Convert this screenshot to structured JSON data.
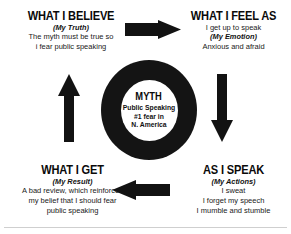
{
  "diagram": {
    "center": {
      "heading": "MYTH",
      "lines": [
        "Public Speaking",
        "#1 fear in",
        "N. America"
      ]
    },
    "quadrants": [
      {
        "id": "believe",
        "heading": "WHAT I BELIEVE",
        "label": "(My Truth)",
        "label_position": "after-heading",
        "lines": [
          "The myth must be true so",
          "i fear public speaking"
        ]
      },
      {
        "id": "feel",
        "heading": "WHAT I FEEL AS",
        "label": "(My Emotion)",
        "label_position": "second-line",
        "lead": "I get up to speak",
        "lines": [
          "Anxious and afraid"
        ]
      },
      {
        "id": "speak",
        "heading": "AS I SPEAK",
        "label": "(My Actions)",
        "label_position": "after-heading",
        "lines": [
          "I sweat",
          "I forget my speech",
          "I mumble and stumble"
        ]
      },
      {
        "id": "get",
        "heading": "WHAT I GET",
        "label": "(My Result)",
        "label_position": "after-heading",
        "lines": [
          "A bad review, which reinforces",
          "my belief that I should fear",
          "public speaking"
        ]
      }
    ],
    "arrows": [
      {
        "id": "top",
        "direction": "right",
        "from": "believe",
        "to": "feel"
      },
      {
        "id": "right",
        "direction": "down",
        "from": "feel",
        "to": "speak"
      },
      {
        "id": "bottom",
        "direction": "left",
        "from": "speak",
        "to": "get"
      },
      {
        "id": "left",
        "direction": "up",
        "from": "get",
        "to": "believe"
      }
    ],
    "colors": {
      "ink": "#121212",
      "background": "#ffffff",
      "rule": "#cfcfcf"
    }
  }
}
